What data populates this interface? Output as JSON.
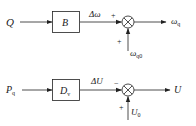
{
  "diagram_top": {
    "input_label": "Q",
    "block_label": "B",
    "intermediate_label": "Δω",
    "sum_sign_left": "+",
    "sum_sign_bottom": "+",
    "reference_label_main": "ω",
    "reference_label_sub": "q0",
    "output_label_main": "ω",
    "output_label_sub": "q"
  },
  "diagram_bottom": {
    "input_label_main": "P",
    "input_label_sub": "q",
    "block_label_main": "D",
    "block_label_sub": "v",
    "intermediate_label": "ΔU",
    "sum_sign_left": "−",
    "sum_sign_bottom": "+",
    "reference_label_main": "U",
    "reference_label_sub": "0",
    "output_label": "U"
  },
  "colors": {
    "line": "#222222",
    "text": "#1a1a1a",
    "background": "#ffffff"
  }
}
